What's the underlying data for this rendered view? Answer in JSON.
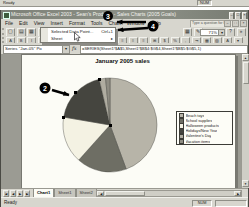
{
  "prior_window_fragment": {
    "status_left": "Ready",
    "num": "NUM"
  },
  "title_bar": {
    "title": "Microsoft Office Excel 2003 - Sean's Products - Sales Charts (2005 Goals)"
  },
  "window_controls": {
    "minimize": "–",
    "restore": "□",
    "close": "×"
  },
  "workbook_controls": {
    "minimize": "–",
    "restore": "□",
    "close": "×"
  },
  "menu_bar": {
    "items": [
      "File",
      "Edit",
      "View",
      "Insert",
      "Format",
      "Tools",
      "Chart",
      "Window",
      "Help"
    ],
    "help_box": "Type a question for help"
  },
  "standard_toolbar": {
    "left_icons": [
      {
        "name": "new-file-icon",
        "glyph": "▢"
      },
      {
        "name": "open-file-icon",
        "glyph": "▤"
      },
      {
        "name": "save-icon",
        "glyph": "▦"
      },
      {
        "name": "print-icon",
        "glyph": "▥"
      },
      {
        "name": "print-preview-icon",
        "glyph": "▧"
      },
      {
        "name": "spelling-icon",
        "glyph": "▣"
      }
    ],
    "right_icons": [
      {
        "name": "chart-wizard-icon",
        "glyph": "▦"
      },
      {
        "name": "drawing-icon",
        "glyph": "✎"
      }
    ],
    "zoom_value": "71%",
    "dropdown_arrow": "▾",
    "after_zoom_icons": [
      {
        "name": "help-icon",
        "glyph": "?"
      },
      {
        "name": "toolbar-options-icon",
        "glyph": "»"
      }
    ]
  },
  "formatting_toolbar": {
    "left_icons": [
      {
        "name": "font-icon",
        "glyph": "A"
      },
      {
        "name": "bold-icon",
        "glyph": "B"
      },
      {
        "name": "italic-icon",
        "glyph": "I"
      },
      {
        "name": "underline-icon",
        "glyph": "U"
      }
    ],
    "right_icons": [
      {
        "name": "align-left-icon",
        "glyph": "≡"
      },
      {
        "name": "align-center-icon",
        "glyph": "≡"
      },
      {
        "name": "align-right-icon",
        "glyph": "≡"
      },
      {
        "name": "merge-center-icon",
        "glyph": "⊞"
      },
      {
        "name": "currency-icon",
        "glyph": "$"
      },
      {
        "name": "percent-icon",
        "glyph": "%"
      },
      {
        "name": "comma-icon",
        "glyph": ","
      },
      {
        "name": "increase-indent-icon",
        "glyph": "⇥"
      },
      {
        "name": "borders-icon",
        "glyph": "▦"
      },
      {
        "name": "fill-color-icon",
        "glyph": "▨"
      },
      {
        "name": "font-color-icon",
        "glyph": "A"
      },
      {
        "name": "fmt-options-icon",
        "glyph": "▾"
      }
    ]
  },
  "format_menu": {
    "items": [
      {
        "label": "Selected Data Point...",
        "shortcut": "Ctrl+1"
      },
      {
        "label": "Sheet",
        "shortcut": ""
      }
    ],
    "submenu_arrow": "▸"
  },
  "formula_bar": {
    "name_box_value": "Series \"Jan-05\" Po",
    "fx_label": "fx",
    "formula": "=SERIES(Sheet1!$A$5,Sheet1!$B$4:$G$4,Sheet1!$B$5:$G$5,1)"
  },
  "callouts": {
    "step2": "2",
    "step3": "3",
    "step4": "4"
  },
  "chart_data": {
    "type": "pie",
    "title": "January 2005 sales",
    "series_name": "Jan-05",
    "labels": [
      "Beach toys",
      "School supplies",
      "Halloween products",
      "Holidays/New Year",
      "Valentine's Day",
      "Vacation items"
    ],
    "values": [
      44.4,
      17.2,
      16.1,
      18.6,
      2.2,
      1.5
    ],
    "values_note": "estimated percent share read from slice angles",
    "colors": [
      "#b7b4a8",
      "#6e6e64",
      "#f4f2e3",
      "#45453f",
      "#b0ada1",
      "#8f8d83"
    ],
    "legend_position": "right",
    "selected_point": "Holidays/New Year"
  },
  "scrollbars": {
    "up": "▲",
    "down": "▼",
    "left": "◀",
    "right": "▶"
  },
  "sheet_tabs": {
    "nav": [
      {
        "name": "first-sheet-button",
        "glyph": "|◀"
      },
      {
        "name": "prev-sheet-button",
        "glyph": "◀"
      },
      {
        "name": "next-sheet-button",
        "glyph": "▶"
      },
      {
        "name": "last-sheet-button",
        "glyph": "▶|"
      }
    ],
    "tabs": [
      {
        "label": "Chart1",
        "active": true
      },
      {
        "label": "Sheet1",
        "active": false
      },
      {
        "label": "Sheet2",
        "active": false
      }
    ]
  },
  "status_bar": {
    "mode": "Ready",
    "num_lock": "NUM"
  }
}
